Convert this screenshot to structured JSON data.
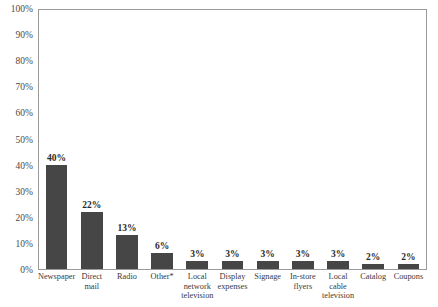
{
  "chart_data": {
    "type": "bar",
    "title": "",
    "xlabel": "",
    "ylabel": "",
    "ylim": [
      0,
      100
    ],
    "ytick_labels": [
      "100%",
      "90%",
      "80%",
      "70%",
      "60%",
      "50%",
      "40%",
      "30%",
      "20%",
      "10%",
      "0%"
    ],
    "ytick_values": [
      100,
      90,
      80,
      70,
      60,
      50,
      40,
      30,
      20,
      10,
      0
    ],
    "grid": false,
    "legend": "none",
    "bar_color": "#464646",
    "axis_color": "#9a9a9a",
    "categories": [
      "Newspaper",
      "Direct mail",
      "Radio",
      "Other*",
      "Local network television",
      "Display expenses",
      "Signage",
      "In-store flyers",
      "Local cable television",
      "Catalog",
      "Coupons"
    ],
    "category_lines": [
      [
        "Newspaper"
      ],
      [
        "Direct",
        "mail"
      ],
      [
        "Radio"
      ],
      [
        "Other*"
      ],
      [
        "Local",
        "network",
        "television"
      ],
      [
        "Display",
        "expenses"
      ],
      [
        "Signage"
      ],
      [
        "In-store",
        "flyers"
      ],
      [
        "Local",
        "cable",
        "television"
      ],
      [
        "Catalog"
      ],
      [
        "Coupons"
      ]
    ],
    "values": [
      40,
      22,
      13,
      6,
      3,
      3,
      3,
      3,
      3,
      2,
      2
    ],
    "value_labels": [
      "40%",
      "22%",
      "13%",
      "6%",
      "3%",
      "3%",
      "3%",
      "3%",
      "3%",
      "2%",
      "2%"
    ]
  }
}
